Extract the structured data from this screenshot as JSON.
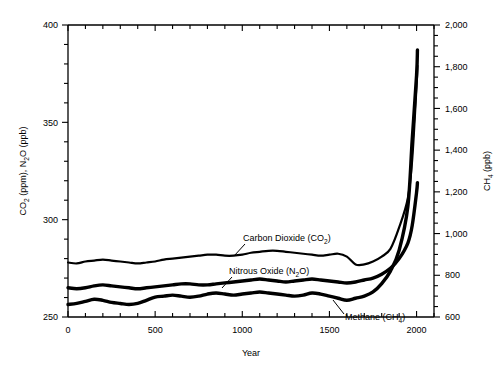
{
  "chart_data": {
    "type": "line",
    "title": "",
    "xlabel": "Year",
    "ylabel_left": "CO2 (ppm), N2O (ppb)",
    "ylabel_right": "CH4 (ppb)",
    "xlim": [
      0,
      2100
    ],
    "ylim_left": [
      250,
      400
    ],
    "ylim_right": [
      600,
      2000
    ],
    "xticks_major": [
      0,
      500,
      1000,
      1500,
      2000
    ],
    "xticks_minor_step": 100,
    "yticks_left_major": [
      250,
      300,
      350,
      400
    ],
    "yticks_left_minor_step": 10,
    "yticks_right_major": [
      600,
      800,
      1000,
      1200,
      1400,
      1600,
      1800,
      2000
    ],
    "yticks_right_minor_step": 50,
    "xtick_labels": [
      "0",
      "500",
      "1000",
      "1500",
      "2000"
    ],
    "ytick_labels_left": [
      "250",
      "300",
      "350",
      "400"
    ],
    "ytick_labels_right": [
      "600",
      "800",
      "1,000",
      "1,200",
      "1,400",
      "1,600",
      "1,800",
      "2,000"
    ],
    "grid": false,
    "legend_position": "inline-annotations",
    "series": [
      {
        "name": "Carbon Dioxide (CO2)",
        "axis": "left",
        "unit": "ppm",
        "linewidth": 2.2,
        "x": [
          0,
          50,
          100,
          150,
          200,
          250,
          300,
          350,
          400,
          450,
          500,
          550,
          600,
          650,
          700,
          750,
          800,
          850,
          900,
          950,
          1000,
          1050,
          1100,
          1150,
          1200,
          1250,
          1300,
          1350,
          1400,
          1450,
          1500,
          1550,
          1600,
          1650,
          1700,
          1750,
          1800,
          1850,
          1900,
          1950,
          1975,
          2000,
          2005
        ],
        "values": [
          278,
          277.5,
          278.5,
          279,
          279.5,
          279,
          278.5,
          278,
          277.5,
          278,
          278.5,
          279.5,
          280,
          280.5,
          281,
          281.5,
          282,
          282,
          281.5,
          281.5,
          282,
          283,
          283.5,
          284,
          284,
          283.5,
          283,
          282.5,
          282,
          281.5,
          282,
          282.5,
          281,
          277,
          277,
          278.5,
          281,
          285,
          296,
          311,
          331,
          369,
          379
        ]
      },
      {
        "name": "Nitrous Oxide (N2O)",
        "axis": "left",
        "unit": "ppb",
        "linewidth": 3.4,
        "x": [
          0,
          50,
          100,
          150,
          200,
          250,
          300,
          350,
          400,
          450,
          500,
          550,
          600,
          650,
          700,
          750,
          800,
          850,
          900,
          950,
          1000,
          1050,
          1100,
          1150,
          1200,
          1250,
          1300,
          1350,
          1400,
          1450,
          1500,
          1550,
          1600,
          1650,
          1700,
          1750,
          1800,
          1850,
          1900,
          1950,
          1975,
          2000,
          2005
        ],
        "values": [
          265,
          264.5,
          265,
          266,
          266.5,
          266,
          265.5,
          265,
          264.5,
          265,
          265.5,
          266,
          266.5,
          267,
          267,
          266.5,
          266.5,
          267,
          267.5,
          268,
          268.5,
          269,
          269.5,
          269,
          268.5,
          268,
          268.5,
          269,
          269.5,
          269,
          268.5,
          268,
          267.5,
          268,
          269,
          270,
          272,
          275,
          280,
          288,
          297,
          314,
          319
        ]
      },
      {
        "name": "Methane (CH4)",
        "axis": "right",
        "unit": "ppb",
        "linewidth": 3.4,
        "x": [
          0,
          50,
          100,
          150,
          200,
          250,
          300,
          350,
          400,
          450,
          500,
          550,
          600,
          650,
          700,
          750,
          800,
          850,
          900,
          950,
          1000,
          1050,
          1100,
          1150,
          1200,
          1250,
          1300,
          1350,
          1400,
          1450,
          1500,
          1550,
          1600,
          1650,
          1700,
          1750,
          1800,
          1850,
          1900,
          1950,
          1975,
          2000,
          2005
        ],
        "values": [
          660,
          665,
          675,
          685,
          680,
          670,
          665,
          660,
          665,
          680,
          695,
          700,
          705,
          700,
          695,
          700,
          710,
          715,
          710,
          705,
          710,
          715,
          720,
          715,
          710,
          705,
          700,
          705,
          715,
          710,
          700,
          690,
          680,
          690,
          700,
          720,
          760,
          820,
          920,
          1130,
          1450,
          1760,
          1880
        ]
      }
    ],
    "annotations": [
      {
        "text": "Carbon Dioxide (CO2)",
        "display": "Carbon Dioxide (CO",
        "sub": "2",
        "tail": ")"
      },
      {
        "text": "Nitrous Oxide (N2O)",
        "display": "Nitrous Oxide (N",
        "sub": "2",
        "tail": "O)"
      },
      {
        "text": "Methane (CH4)",
        "display": "Methane (CH",
        "sub": "4",
        "tail": ")"
      }
    ]
  },
  "labels": {
    "x_axis_title": "Year",
    "y_left_part1": "CO",
    "y_left_sub1": "2",
    "y_left_part2": " (ppm), N",
    "y_left_sub2": "2",
    "y_left_part3": "O (ppb)",
    "y_right_part1": "CH",
    "y_right_sub": "4",
    "y_right_part2": " (ppb)",
    "annot_co2_a": "Carbon Dioxide (CO",
    "annot_co2_sub": "2",
    "annot_co2_b": ")",
    "annot_n2o_a": "Nitrous Oxide (N",
    "annot_n2o_sub": "2",
    "annot_n2o_b": "O)",
    "annot_ch4_a": "Methane (CH",
    "annot_ch4_sub": "4",
    "annot_ch4_b": ")"
  },
  "colors": {
    "line": "#000000",
    "axis": "#000000",
    "background": "#ffffff"
  }
}
